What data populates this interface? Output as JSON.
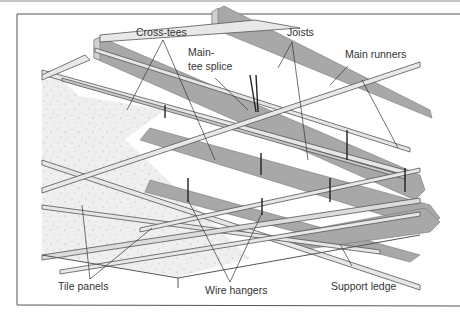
{
  "diagram": {
    "labels": {
      "cross_tees": "Cross-tees",
      "main_tee_splice_line1": "Main-",
      "main_tee_splice_line2": "tee splice",
      "joists": "Joists",
      "main_runners": "Main runners",
      "tile_panels": "Tile panels",
      "wire_hangers": "Wire hangers",
      "support_ledge": "Support ledge"
    },
    "colors": {
      "joist_fill": "#a8a8a8",
      "joist_side": "#d6d6d6",
      "runner_fill": "#e4e4e4",
      "runner_edge": "#6a6a6a",
      "tile_fill": "#f0f0f0",
      "frame": "#555555",
      "leader": "#333333"
    }
  }
}
